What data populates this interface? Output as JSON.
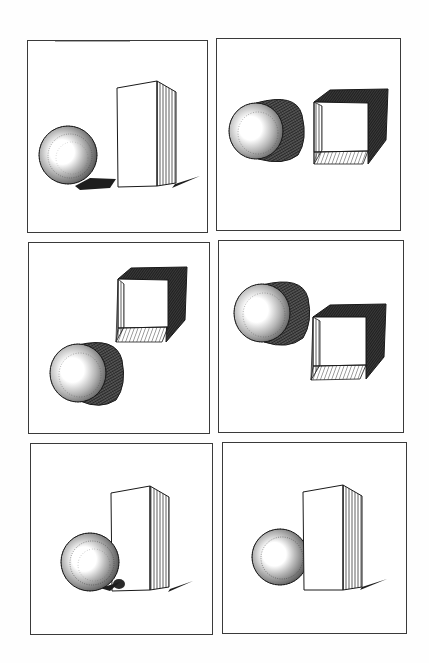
{
  "page": {
    "title": ""
  },
  "colors": {
    "ink": "#1a1a1a",
    "frame": "#3a3a3a",
    "paper": "#ffffff",
    "shadow": "#222222"
  },
  "panels": [
    {
      "id": 1,
      "label": "",
      "subjects": [
        "sphere",
        "rectangular-block"
      ],
      "arrangement": "sphere left, block right, separated"
    },
    {
      "id": 2,
      "label": "",
      "subjects": [
        "cylinder",
        "open-cube"
      ],
      "arrangement": "cylinder left, open cube right, side by side"
    },
    {
      "id": 3,
      "label": "",
      "subjects": [
        "open-cube",
        "cylinder"
      ],
      "arrangement": "open cube upper right, cylinder lower left"
    },
    {
      "id": 4,
      "label": "",
      "subjects": [
        "cylinder",
        "open-cube"
      ],
      "arrangement": "cylinder upper left, open cube lower right"
    },
    {
      "id": 5,
      "label": "",
      "subjects": [
        "sphere",
        "rectangular-block"
      ],
      "arrangement": "sphere in front of block, overlapping"
    },
    {
      "id": 6,
      "label": "",
      "subjects": [
        "sphere",
        "rectangular-block"
      ],
      "arrangement": "sphere partially behind block"
    }
  ]
}
